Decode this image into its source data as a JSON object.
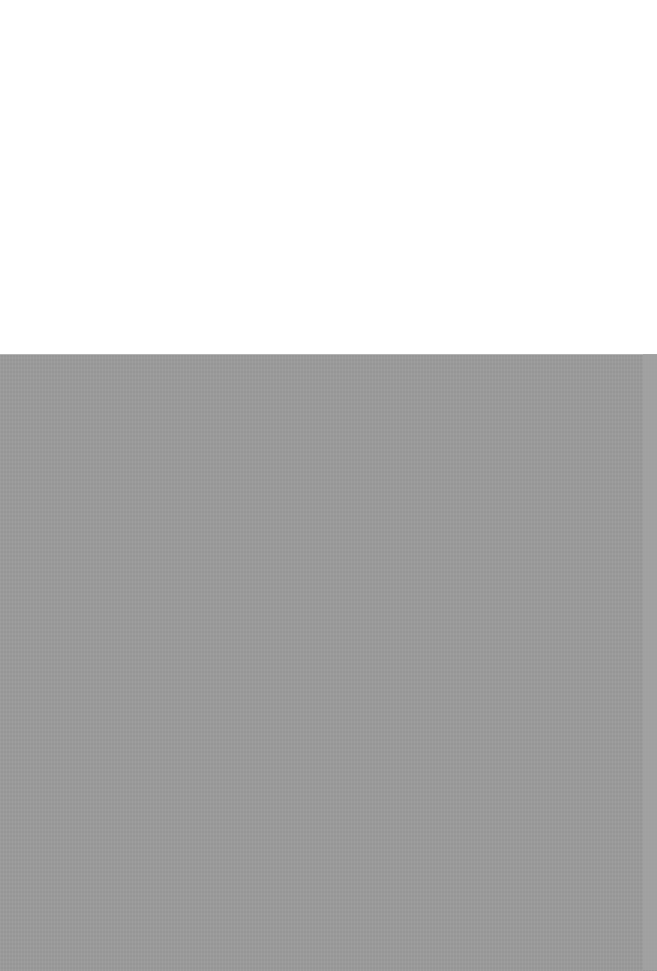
{
  "regions": {
    "top": {
      "color": "#ffffff"
    },
    "bottom": {
      "color": "#9b9b9b"
    },
    "edge": {
      "color": "#a3a3a3"
    }
  }
}
